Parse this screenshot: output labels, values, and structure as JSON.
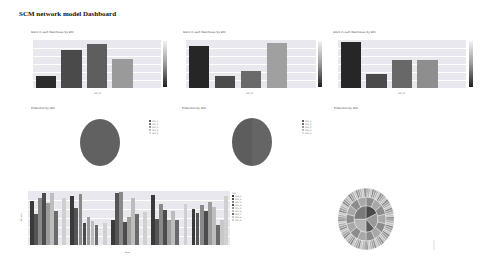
{
  "dashboard": {
    "title": "SCM network model Dashboard"
  },
  "panels": {
    "bar1": {
      "title": "Stock in each Warehouse by SKU",
      "xlabel": "SKU_ID",
      "ylabel": "Stock"
    },
    "bar2": {
      "title": "Stock in each Warehouse by SKU",
      "xlabel": "SKU_ID",
      "ylabel": "Stock"
    },
    "bar3": {
      "title": "Stock in each Warehouse by SKU",
      "xlabel": "SKU_ID",
      "ylabel": "Stock"
    },
    "pie1": {
      "title": "Production by SKU"
    },
    "pie2": {
      "title": "Production by SKU"
    },
    "pie3": {
      "title": "Production by SKU"
    },
    "grouped": {
      "xlabel": "Date",
      "ylabel": "Demand",
      "legend_title": "SKU"
    },
    "sunburst": {
      "title": ""
    }
  },
  "chart_data": [
    {
      "id": "bar1",
      "type": "bar",
      "title": "Stock in each Warehouse by SKU",
      "xlabel": "SKU_ID",
      "ylabel": "Stock",
      "categories": [
        "1",
        "2",
        "3",
        "4",
        "5"
      ],
      "values": [
        20,
        63,
        73,
        48,
        0
      ],
      "colors": [
        "#2b2b2b",
        "#4a4a4a",
        "#5e5e5e",
        "#9a9a9a",
        "#e8e8ee"
      ],
      "ylim": [
        0,
        80
      ],
      "colorbar": true
    },
    {
      "id": "bar2",
      "type": "bar",
      "title": "Stock in each Warehouse by SKU",
      "xlabel": "SKU_ID",
      "ylabel": "Stock",
      "categories": [
        "1",
        "2",
        "3",
        "4",
        "5"
      ],
      "values": [
        75,
        22,
        30,
        80,
        0
      ],
      "colors": [
        "#262626",
        "#4b4b4b",
        "#6a6a6a",
        "#a0a0a0",
        "#e8e8ee"
      ],
      "ylim": [
        0,
        85
      ],
      "colorbar": true
    },
    {
      "id": "bar3",
      "type": "bar",
      "title": "Stock in each Warehouse by SKU",
      "xlabel": "SKU_ID",
      "ylabel": "Stock",
      "categories": [
        "1",
        "2",
        "3",
        "4",
        "5"
      ],
      "values": [
        78,
        24,
        48,
        48,
        0
      ],
      "colors": [
        "#262626",
        "#4a4a4a",
        "#686868",
        "#8e8e8e",
        "#e8e8ee"
      ],
      "ylim": [
        0,
        82
      ],
      "colorbar": true
    },
    {
      "id": "pie1",
      "type": "pie",
      "title": "Production by SKU",
      "labels": [
        "SKU_1",
        "SKU_2",
        "SKU_3",
        "SKU_4",
        "SKU_5"
      ],
      "values": [
        97,
        1,
        1,
        0.5,
        0.5
      ],
      "colors": [
        "#5f5f5f",
        "#7a7a7a",
        "#9a9a9a",
        "#bbbbbb",
        "#dddddd"
      ]
    },
    {
      "id": "pie2",
      "type": "pie",
      "title": "Production by SKU",
      "labels": [
        "SKU_1",
        "SKU_2",
        "SKU_3",
        "SKU_4",
        "SKU_5"
      ],
      "values": [
        50,
        48,
        1,
        0.5,
        0.5
      ],
      "colors": [
        "#5f5f5f",
        "#6e6e6e",
        "#9a9a9a",
        "#bbbbbb",
        "#dddddd"
      ]
    },
    {
      "id": "pie3",
      "type": "pie",
      "title": "Production by SKU",
      "labels": [],
      "values": []
    },
    {
      "id": "grouped",
      "type": "bar",
      "xlabel": "Date",
      "ylabel": "Demand",
      "categories": [
        "D1",
        "D2",
        "D3",
        "D4",
        "D5"
      ],
      "legend_title": "SKU",
      "series": [
        {
          "name": "SKU_1",
          "color": "#3a3a3a",
          "values": [
            97,
            108,
            55,
            112,
            80
          ]
        },
        {
          "name": "SKU_2",
          "color": "#555555",
          "values": [
            68,
            82,
            115,
            57,
            72
          ]
        },
        {
          "name": "SKU_3",
          "color": "#8a8a8a",
          "values": [
            104,
            114,
            118,
            91,
            88
          ]
        },
        {
          "name": "SKU_4",
          "color": "#4c4c4c",
          "values": [
            116,
            50,
            52,
            78,
            75
          ]
        },
        {
          "name": "SKU_5",
          "color": "#9c9c9c",
          "values": [
            94,
            62,
            62,
            56,
            95
          ]
        },
        {
          "name": "SKU_6",
          "color": "#bdbdbd",
          "values": [
            115,
            53,
            105,
            75,
            85
          ]
        },
        {
          "name": "SKU_7",
          "color": "#6a6a6a",
          "values": [
            75,
            45,
            70,
            55,
            45
          ]
        },
        {
          "name": "SKU_8",
          "color": "#c8c8c8",
          "values": [
            0,
            0,
            0,
            0,
            55
          ]
        },
        {
          "name": "SKU_9",
          "color": "#d0d0d0",
          "values": [
            104,
            50,
            74,
            91,
            110
          ]
        }
      ],
      "ylim": [
        0,
        120
      ],
      "legend_position": "right",
      "grid": true
    },
    {
      "id": "sunburst",
      "type": "pie",
      "title": "",
      "rings": 3,
      "note": "sunburst with dark wedge center and dense outer ring"
    }
  ]
}
